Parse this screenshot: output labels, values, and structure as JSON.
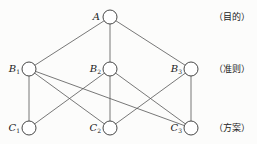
{
  "diagram": {
    "type": "hierarchy",
    "levels": [
      {
        "label": "（目的）",
        "y": 17,
        "nodes": [
          {
            "id": "A",
            "name": "A",
            "sub": "",
            "x": 110
          }
        ]
      },
      {
        "label": "（准则）",
        "y": 69,
        "nodes": [
          {
            "id": "B1",
            "name": "B",
            "sub": "1",
            "x": 29
          },
          {
            "id": "B2",
            "name": "B",
            "sub": "2",
            "x": 110
          },
          {
            "id": "B3",
            "name": "B",
            "sub": "3",
            "x": 191
          }
        ]
      },
      {
        "label": "（方案）",
        "y": 128,
        "nodes": [
          {
            "id": "C1",
            "name": "C",
            "sub": "1",
            "x": 29
          },
          {
            "id": "C2",
            "name": "C",
            "sub": "2",
            "x": 110
          },
          {
            "id": "C3",
            "name": "C",
            "sub": "3",
            "x": 191
          }
        ]
      }
    ],
    "edges": [
      [
        "A",
        "B1"
      ],
      [
        "A",
        "B2"
      ],
      [
        "A",
        "B3"
      ],
      [
        "B1",
        "C1"
      ],
      [
        "B1",
        "C2"
      ],
      [
        "B1",
        "C3"
      ],
      [
        "B2",
        "C1"
      ],
      [
        "B2",
        "C2"
      ],
      [
        "B2",
        "C3"
      ],
      [
        "B3",
        "C2"
      ],
      [
        "B3",
        "C3"
      ]
    ]
  }
}
